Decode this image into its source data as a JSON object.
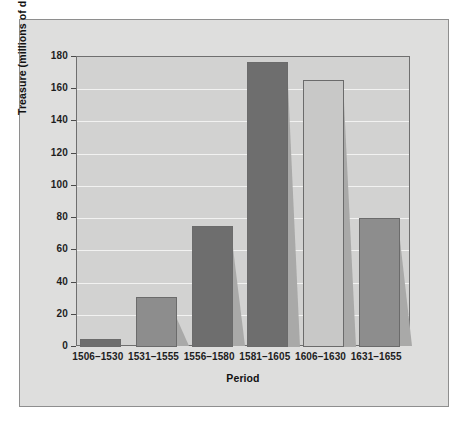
{
  "chart_data": {
    "type": "bar",
    "title": "",
    "xlabel": "Period",
    "ylabel": "Treasure (millions of ducats)",
    "categories": [
      "1506–1530",
      "1531–1555",
      "1556–1580",
      "1581–1605",
      "1606–1630",
      "1631–1655"
    ],
    "values": [
      5,
      31,
      75,
      177,
      166,
      80
    ],
    "ylim": [
      0,
      180
    ],
    "yticks": [
      0,
      20,
      40,
      60,
      80,
      100,
      120,
      140,
      160,
      180
    ],
    "ytick_labels": [
      "0",
      "20",
      "40",
      "60",
      "80",
      "100",
      "120",
      "140",
      "160",
      "180"
    ],
    "grid": true,
    "legend": "none",
    "bar_colors": [
      "#6e6e6e",
      "#8d8d8d",
      "#6e6e6e",
      "#6e6e6e",
      "#c8c8c7",
      "#8d8d8d"
    ],
    "series": [
      {
        "name": "Treasure",
        "values": [
          5,
          31,
          75,
          177,
          166,
          80
        ]
      }
    ]
  },
  "colors": {
    "page_background": "#ffffff",
    "figure_background": "#dededd",
    "plot_background": "#d2d2d1",
    "gridline": "#f2f2f1",
    "axis_line": "#6f6f6f",
    "text": "#1d1d1d",
    "bar_dark": "#6e6e6e",
    "bar_mid": "#8d8d8d",
    "bar_light": "#c8c8c7",
    "bar_shadow": "#a9a9a8"
  }
}
